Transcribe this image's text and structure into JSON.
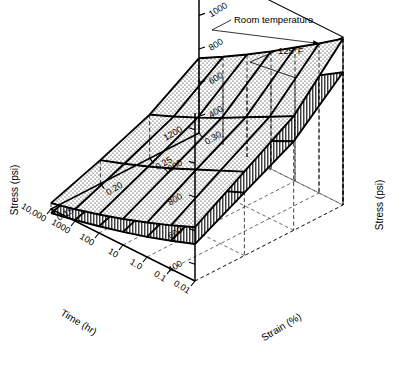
{
  "figure": {
    "kind": "3d-surface-plot",
    "background_color": "#ffffff",
    "ink_color": "#000000"
  },
  "annotations": {
    "upper_surface": "Room temperature",
    "lower_surface": "125°F"
  },
  "axes": {
    "stress_left": {
      "title": "Stress (psi)",
      "ticks": [
        "1200",
        "1000",
        "800",
        "600",
        "400"
      ]
    },
    "stress_right": {
      "title": "Stress (psi)",
      "ticks": [
        "1200",
        "1000",
        "800",
        "600",
        "400"
      ]
    },
    "time": {
      "title": "Time (hr)",
      "ticks": [
        "0.01",
        "0.1",
        "1.0",
        "10",
        "100",
        "1000",
        "10,000"
      ]
    },
    "strain": {
      "title": "Strain (%)",
      "ticks": [
        "0.15",
        "0.20",
        "0.25",
        "0.30"
      ]
    }
  },
  "chart_data": {
    "type": "surface",
    "title": "",
    "xlabel": "Time (hr)",
    "ylabel": "Strain (%)",
    "zlabel": "Stress (psi)",
    "x": [
      0.01,
      0.1,
      1.0,
      10,
      100,
      1000,
      10000
    ],
    "x_ticklabels": [
      "0.01",
      "0.1",
      "1.0",
      "10",
      "100",
      "1000",
      "10,000"
    ],
    "x_scale": "log",
    "y": [
      0.15,
      0.2,
      0.25,
      0.3
    ],
    "y_ticklabels": [
      "0.15",
      "0.20",
      "0.25",
      "0.30"
    ],
    "zlim": [
      300,
      1300
    ],
    "z_ticklabels": [
      "400",
      "600",
      "800",
      "1000",
      "1200"
    ],
    "grid": true,
    "legend_position": "annotation-leaders",
    "series": [
      {
        "name": "Room temperature",
        "fill": "stipple",
        "comment": "upper surface; stress declines with log time and rises with strain",
        "z": [
          [
            620,
            800,
            980,
            1290
          ],
          [
            560,
            735,
            905,
            1190
          ],
          [
            505,
            670,
            830,
            1095
          ],
          [
            455,
            605,
            755,
            1000
          ],
          [
            410,
            545,
            685,
            910
          ],
          [
            370,
            490,
            620,
            825
          ],
          [
            335,
            440,
            560,
            745
          ]
        ]
      },
      {
        "name": "125°F",
        "fill": "hatch",
        "comment": "lower surface; same trends, uniformly lower stress",
        "z": [
          [
            520,
            675,
            830,
            1090
          ],
          [
            468,
            615,
            760,
            1000
          ],
          [
            420,
            558,
            692,
            915
          ],
          [
            378,
            503,
            628,
            832
          ],
          [
            340,
            452,
            568,
            755
          ],
          [
            306,
            405,
            512,
            683
          ],
          [
            276,
            362,
            462,
            616
          ]
        ]
      }
    ]
  }
}
